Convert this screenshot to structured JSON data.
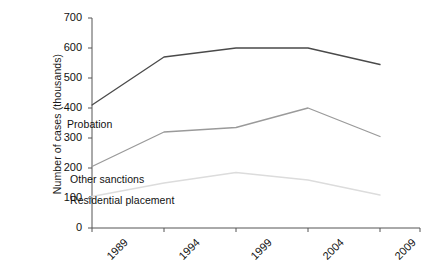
{
  "chart_data": {
    "type": "line",
    "title": "",
    "xlabel": "",
    "ylabel": "Number of cases (thousands)",
    "categories": [
      "1989",
      "1994",
      "1999",
      "2004",
      "2009"
    ],
    "x": [
      1989,
      1994,
      1999,
      2004,
      2009
    ],
    "xlim": [
      1989,
      2009
    ],
    "ylim": [
      0,
      700
    ],
    "y_ticks": [
      0,
      100,
      200,
      300,
      400,
      500,
      600,
      700
    ],
    "y_tick_labels": [
      "0",
      "100",
      "200",
      "300",
      "400",
      "500",
      "600",
      "700"
    ],
    "x_tick_labels": [
      "1989",
      "1994",
      "1999",
      "2004",
      "2009"
    ],
    "x_tick_rotation": -45,
    "grid": false,
    "legend": "inline-labels",
    "series": [
      {
        "name": "Probation",
        "label": "Probation",
        "color": "#4a4a4a",
        "values": [
          410,
          570,
          600,
          600,
          545
        ]
      },
      {
        "name": "Other sanctions",
        "label": "Other sanctions",
        "color": "#9a9a9a",
        "values": [
          205,
          320,
          335,
          400,
          305
        ]
      },
      {
        "name": "Residential placement",
        "label": "Residential placement",
        "color": "#dcdcdc",
        "values": [
          105,
          150,
          185,
          160,
          110
        ]
      }
    ],
    "annotations": [
      {
        "text": "Probation",
        "series": "Probation"
      },
      {
        "text": "Other sanctions",
        "series": "Other sanctions"
      },
      {
        "text": "Residential placement",
        "series": "Residential placement"
      }
    ],
    "axis_color": "#555555",
    "background": "#ffffff"
  },
  "axis": {
    "y_title": "Number of cases (thousands)",
    "y_labels": [
      "700",
      "600",
      "500",
      "400",
      "300",
      "200",
      "100",
      "0"
    ],
    "x_labels": [
      "1989",
      "1994",
      "1999",
      "2004",
      "2009"
    ]
  },
  "labels": {
    "probation": "Probation",
    "other_sanctions": "Other sanctions",
    "residential_placement": "Residential placement"
  }
}
